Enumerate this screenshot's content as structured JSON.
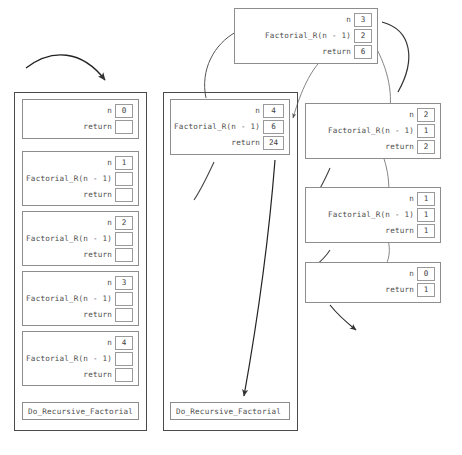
{
  "figure": {
    "caption": "",
    "label_n": "n",
    "label_call": "Factorial_R(n - 1)",
    "label_return": "return",
    "colors": {
      "frame_border": "#4a4a4a",
      "box_border": "#8d8d8d",
      "field_border": "#9a9a9a",
      "arrow": "#5a5a5a",
      "arrow_dark": "#222222",
      "text": "#4d4d4d",
      "background": "#ffffff"
    }
  },
  "left_stack": {
    "name": "unwound-stack",
    "caller_label": "Do_Recursive_Factorial",
    "records": [
      {
        "n": "0",
        "call": null,
        "ret": ""
      },
      {
        "n": "1",
        "call": "Factorial_R(n - 1)",
        "ret": ""
      },
      {
        "n": "2",
        "call": "Factorial_R(n - 1)",
        "ret": ""
      },
      {
        "n": "3",
        "call": "Factorial_R(n - 1)",
        "ret": ""
      },
      {
        "n": "4",
        "call": "Factorial_R(n - 1)",
        "ret": ""
      }
    ]
  },
  "middle_stack": {
    "name": "returning-stack",
    "caller_label": "Do_Recursive_Factorial",
    "records": [
      {
        "n": "4",
        "call": "Factorial_R(n - 1)",
        "call_val": "6",
        "ret": "24"
      }
    ]
  },
  "right_records": [
    {
      "n": "3",
      "call": "Factorial_R(n - 1)",
      "call_val": "2",
      "ret": "6"
    },
    {
      "n": "2",
      "call": "Factorial_R(n - 1)",
      "call_val": "1",
      "ret": "2"
    },
    {
      "n": "1",
      "call": "Factorial_R(n - 1)",
      "call_val": "1",
      "ret": "1"
    },
    {
      "n": "0",
      "call": null,
      "call_val": null,
      "ret": "1"
    }
  ]
}
